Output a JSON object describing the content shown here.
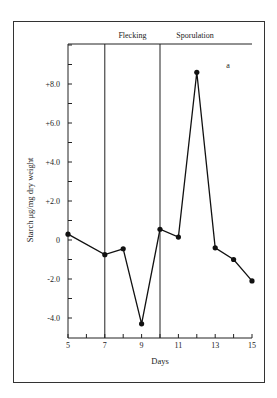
{
  "chart_data": {
    "type": "line",
    "title": "",
    "panel_label": "a",
    "xlabel": "Days",
    "ylabel": "Starch μg/mg dry weight",
    "x": [
      5,
      7,
      8,
      9,
      10,
      11,
      12,
      13,
      14,
      15
    ],
    "series": [
      {
        "name": "Starch",
        "values": [
          0.3,
          -0.75,
          -0.45,
          -4.3,
          0.55,
          0.15,
          8.6,
          -0.4,
          -1.0,
          -2.1
        ]
      }
    ],
    "xlim": [
      5,
      15
    ],
    "ylim": [
      -5.0,
      10.0
    ],
    "x_ticks": [
      5,
      6,
      7,
      8,
      9,
      10,
      11,
      12,
      13,
      14,
      15
    ],
    "x_tick_labels": [
      "5",
      "7",
      "9",
      "11",
      "13",
      "15"
    ],
    "y_ticks": [
      -4.0,
      -3.0,
      -2.0,
      -1.0,
      0,
      1.0,
      2.0,
      3.0,
      4.0,
      5.0,
      6.0,
      7.0,
      8.0,
      9.0,
      10.0
    ],
    "y_tick_labels": [
      "-4.0",
      "-2.0",
      "0",
      "+2.0",
      "+4.0",
      "+6.0",
      "+8.0"
    ],
    "phases": [
      {
        "label": "Flecking",
        "start": 7,
        "end": 10
      },
      {
        "label": "Sporulation",
        "start": 10,
        "end": 15
      }
    ],
    "grid": false,
    "legend": null
  }
}
